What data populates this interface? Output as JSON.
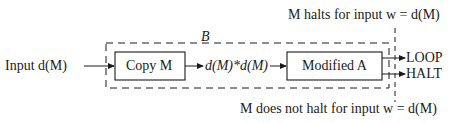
{
  "diagram": {
    "input_label": "Input d(M)",
    "outer_box": {
      "label": "B",
      "style": "dashed"
    },
    "copy_box": {
      "label": "Copy M"
    },
    "intermediate_label": "d(M)*d(M)",
    "modified_box": {
      "label": "Modified A"
    },
    "outputs": [
      {
        "label": "LOOP"
      },
      {
        "label": "HALT"
      }
    ],
    "top_annotation": "M halts for input w = d(M)",
    "bottom_annotation": "M does not halt for input w = d(M)"
  },
  "colors": {
    "line": "#1a1a1a",
    "background": "#ffffff"
  }
}
